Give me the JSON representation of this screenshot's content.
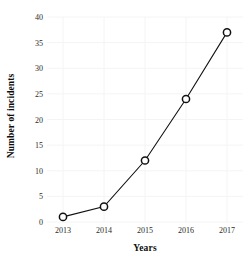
{
  "chart_data": {
    "type": "line",
    "title": "",
    "subtitle": "",
    "xlabel": "Years",
    "ylabel": "Number of incidents",
    "categories": [
      "2013",
      "2014",
      "2015",
      "2016",
      "2017"
    ],
    "x": [
      2013,
      2014,
      2015,
      2016,
      2017
    ],
    "values": [
      1,
      3,
      12,
      24,
      37
    ],
    "series": [
      {
        "name": "Number of incidents",
        "values": [
          1,
          3,
          12,
          24,
          37
        ]
      }
    ],
    "ylim": [
      0,
      40
    ],
    "yticks": [
      0,
      5,
      10,
      15,
      20,
      25,
      30,
      35,
      40
    ],
    "ytick_labels": [
      "0",
      "5",
      "10",
      "15",
      "20",
      "25",
      "30",
      "35",
      "40"
    ],
    "xtick_labels": [
      "2013",
      "2014",
      "2015",
      "2016",
      "2017"
    ],
    "grid": true,
    "legend": false,
    "legend_position": "none",
    "annotations": [],
    "colors": {
      "line": "#111111",
      "marker_fill": "#ffffff",
      "marker_stroke": "#111111",
      "grid": "#f4f4f4",
      "text": "#2b2b2b",
      "background": "#ffffff"
    },
    "marker_style": "open-circle"
  }
}
